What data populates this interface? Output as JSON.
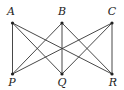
{
  "diagram": {
    "type": "bipartite-graph",
    "nodes": [
      {
        "id": "A",
        "label": "A",
        "x": 12.5,
        "y": 23,
        "lx": 11,
        "ly": 15
      },
      {
        "id": "B",
        "label": "B",
        "x": 62,
        "y": 23,
        "lx": 62,
        "ly": 15
      },
      {
        "id": "C",
        "label": "C",
        "x": 112,
        "y": 23,
        "lx": 112,
        "ly": 15
      },
      {
        "id": "P",
        "label": "P",
        "x": 12.5,
        "y": 74,
        "lx": 12,
        "ly": 86
      },
      {
        "id": "Q",
        "label": "Q",
        "x": 62,
        "y": 74,
        "lx": 62,
        "ly": 86
      },
      {
        "id": "R",
        "label": "R",
        "x": 112,
        "y": 74,
        "lx": 113,
        "ly": 86
      }
    ],
    "edges": [
      [
        "A",
        "P"
      ],
      [
        "A",
        "Q"
      ],
      [
        "A",
        "R"
      ],
      [
        "B",
        "P"
      ],
      [
        "B",
        "Q"
      ],
      [
        "B",
        "R"
      ],
      [
        "C",
        "P"
      ],
      [
        "C",
        "Q"
      ],
      [
        "C",
        "R"
      ]
    ]
  }
}
